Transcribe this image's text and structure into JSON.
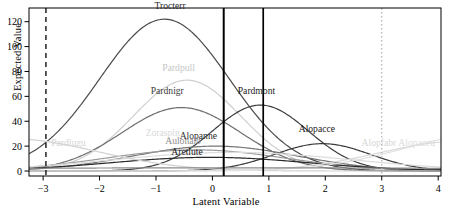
{
  "chart_data": {
    "type": "line",
    "title": "",
    "xlabel": "Latent Variable",
    "ylabel": "Expected Value",
    "xlim": [
      -3.25,
      4.05
    ],
    "ylim": [
      -4,
      131
    ],
    "xticks": [
      -3,
      -2,
      -1,
      0,
      1,
      2,
      3,
      4
    ],
    "xticklabels": [
      "−3",
      "−2",
      "−1",
      "0",
      "1",
      "2",
      "3",
      "4"
    ],
    "yticks": [
      0,
      20,
      40,
      60,
      80,
      100,
      120
    ],
    "yticklabels": [
      "0",
      "20",
      "40",
      "60",
      "80",
      "100",
      "120"
    ],
    "grid": false,
    "legend": "none (curves labelled in-place)",
    "note": "Gaussian response curves of species against a latent environmental gradient",
    "series": [
      {
        "name": "Trocterr",
        "label": "Trocterr",
        "color": "#4a4a4a",
        "width": 1.2,
        "peak_x": -0.85,
        "peak_y": 122,
        "tolerance": 1.15,
        "label_x": -0.75,
        "label_y": 130,
        "label_color": "#2b2b2b"
      },
      {
        "name": "Pardpull",
        "label": "Pardpull",
        "color": "#cfcfcf",
        "width": 1.2,
        "peak_x": -0.45,
        "peak_y": 73,
        "tolerance": 0.95,
        "label_x": -0.6,
        "label_y": 80,
        "label_color": "#c6c6c6"
      },
      {
        "name": "Pardnigr",
        "label": "Pardnigr",
        "color": "#6e6e6e",
        "width": 1.2,
        "peak_x": -0.55,
        "peak_y": 51,
        "tolerance": 1.05,
        "label_x": -0.8,
        "label_y": 62,
        "label_color": "#3a3a3a"
      },
      {
        "name": "Pardmont",
        "label": "Pardmont",
        "color": "#3d3d3d",
        "width": 1.2,
        "peak_x": 0.85,
        "peak_y": 53,
        "tolerance": 0.85,
        "label_x": 0.78,
        "label_y": 62,
        "label_color": "#1c1c1c"
      },
      {
        "name": "Alopacce",
        "label": "Alopacce",
        "color": "#3a3a3a",
        "width": 1.2,
        "peak_x": 1.95,
        "peak_y": 22,
        "tolerance": 0.85,
        "label_x": 1.85,
        "label_y": 31,
        "label_color": "#202020"
      },
      {
        "name": "Alopanne",
        "label": "Alopanne",
        "color": "#757575",
        "width": 1.2,
        "peak_x": 0.05,
        "peak_y": 20,
        "tolerance": 1.45,
        "label_x": -0.25,
        "label_y": 26,
        "label_color": "#2e2e2e"
      },
      {
        "name": "Aulonalb",
        "label": "Aulonalb",
        "color": "#9a9a9a",
        "width": 1.2,
        "peak_x": -0.3,
        "peak_y": 17,
        "tolerance": 1.6,
        "label_x": -0.52,
        "label_y": 22,
        "label_color": "#8d8d8d"
      },
      {
        "name": "Arctlute",
        "label": "Arctlute",
        "color": "#2a2a2a",
        "width": 1.2,
        "peak_x": -0.05,
        "peak_y": 11,
        "tolerance": 1.75,
        "label_x": -0.45,
        "label_y": 13,
        "label_color": "#171717"
      },
      {
        "name": "Zoraspin",
        "label": "Zoraspin",
        "color": "#dcdcdc",
        "width": 1.2,
        "peak_x": 0.35,
        "peak_y": 15,
        "tolerance": 2.1,
        "label_x": -0.88,
        "label_y": 28,
        "label_color": "#dadada"
      },
      {
        "name": "Pardlugu",
        "label": "Pardlugu",
        "color": "#d2d2d2",
        "width": 1.2,
        "peak_x": -3.6,
        "peak_y": 26,
        "tolerance": 1.55,
        "label_x": -2.55,
        "label_y": 20,
        "label_color": "#d4d4d4"
      },
      {
        "name": "Alopfabr",
        "label": "Alopfabr",
        "color": "#dadada",
        "width": 1.2,
        "peak_x": 4.4,
        "peak_y": 24,
        "tolerance": 1.45,
        "label_x": 2.95,
        "label_y": 20,
        "label_color": "#d6d6d6"
      },
      {
        "name": "Alopaccu",
        "label": "Alopaccu",
        "color": "#e0e0e0",
        "width": 1.2,
        "peak_x": 4.9,
        "peak_y": 30,
        "tolerance": 1.5,
        "label_x": 3.62,
        "label_y": 20,
        "label_color": "#dcdcdc"
      },
      {
        "name": "baseline-flat",
        "label": "",
        "color": "#8a8a8a",
        "width": 1.2,
        "peak_x": 0.3,
        "peak_y": 2.6,
        "tolerance": 6.0,
        "label_x": null,
        "label_y": null,
        "label_color": "#8a8a8a"
      }
    ],
    "reference_lines": [
      {
        "name": "dashed-left",
        "x": -2.95,
        "style": "dashed",
        "color": "#000000",
        "width": 1.3
      },
      {
        "name": "solid-inner",
        "x": 0.2,
        "style": "solid",
        "color": "#000000",
        "width": 2.0
      },
      {
        "name": "solid-outer",
        "x": 0.9,
        "style": "solid",
        "color": "#000000",
        "width": 1.7
      },
      {
        "name": "dotted-right",
        "x": 3.0,
        "style": "dotted",
        "color": "#b4b4b4",
        "width": 1.3
      }
    ]
  }
}
